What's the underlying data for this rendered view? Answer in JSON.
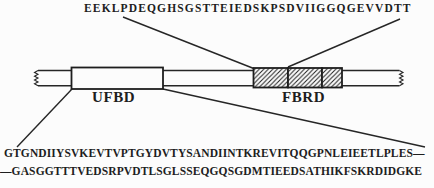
{
  "figure": {
    "top_sequence": "EEKLPDEQGHSGSTTEIEDSKPSDVIIGGQGEVVDTT",
    "ufbd_label": "UFBD",
    "fbrd_label": "FBRD",
    "bottom_sequence_line1": "GTGNDIIYSVKEVTVPTGYDVTYSANDIINTKREVITQQGPNLEIEETLPLES—",
    "bottom_sequence_line2": "—GASGGTTTVEDSRPVDTLSGLSSEQGQSGDMTIEEDSATHIKFSKRDIDGKE",
    "colors": {
      "ink": "#1e1e1e",
      "paper": "#fcfcfc",
      "domain_fill": "#fcfcfc"
    }
  }
}
